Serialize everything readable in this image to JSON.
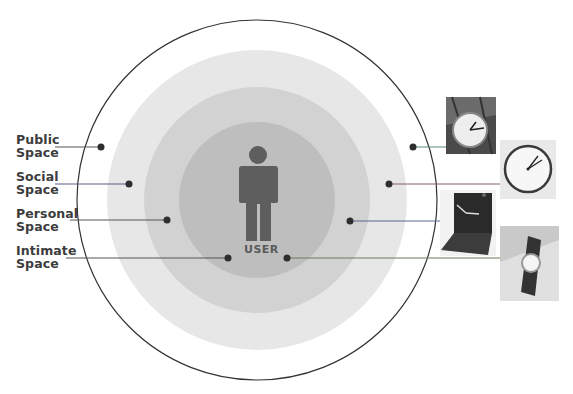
{
  "diagram": {
    "zones": [
      {
        "label_line1": "Public",
        "label_line2": "Space",
        "object": "station clock"
      },
      {
        "label_line1": "Social",
        "label_line2": "Space",
        "object": "wall clock"
      },
      {
        "label_line1": "Personal",
        "label_line2": "Space",
        "object": "travel alarm clock"
      },
      {
        "label_line1": "Intimate",
        "label_line2": "Space",
        "object": "wristwatch"
      }
    ],
    "center_label": "USER",
    "colors": {
      "outer_ring_stroke": "#333333",
      "public_fill": "#ffffff",
      "social_fill": "#e6e6e6",
      "personal_fill": "#d1d1d1",
      "intimate_fill": "#bdbdbd",
      "user_figure": "#5e5e5e",
      "dot": "#2e2e2e",
      "leader_line": "#555555"
    }
  }
}
